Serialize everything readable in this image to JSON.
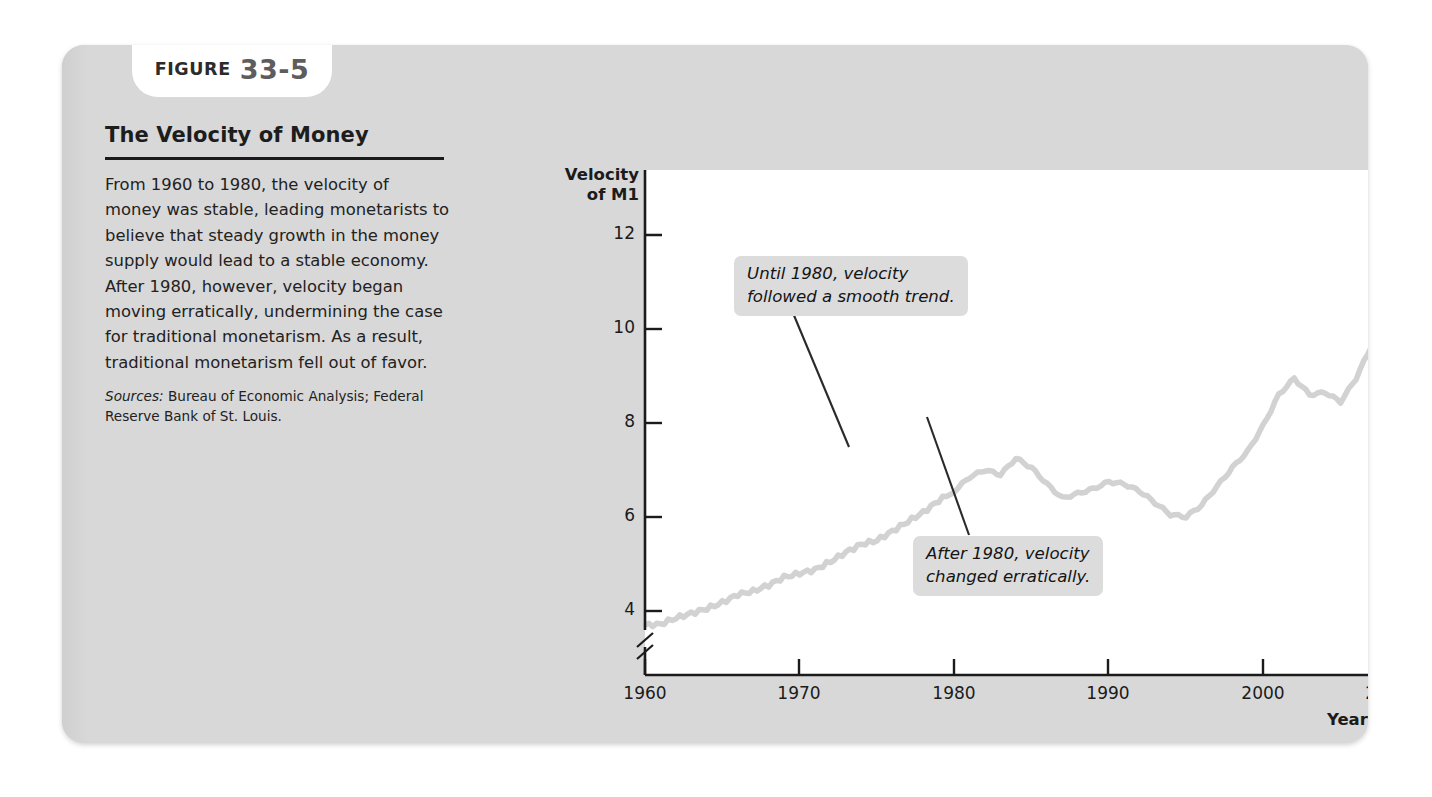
{
  "figure": {
    "tab_word": "FIGURE",
    "tab_number": "33-5",
    "title": "The Velocity of Money",
    "caption": "From 1960 to 1980, the velocity of money was stable, leading monetarists to believe that steady growth in the money supply would lead to a stable economy. After 1980, however, velocity began moving erratically, undermining the case for traditional monetarism. As a result, traditional monetarism fell out of favor.",
    "sources_label": "Sources:",
    "sources_text": " Bureau of Economic Analysis; Federal Reserve Bank of St. Louis.",
    "card_color": "#d8d8d8",
    "line_color": "#d2d2d2",
    "axis_color": "#1b1b1b",
    "callout_bg": "#dcdcdc"
  },
  "chart_data": {
    "type": "line",
    "title": "The Velocity of Money",
    "xlabel": "Year",
    "ylabel": "Velocity of M1",
    "ylabel_line1": "Velocity",
    "ylabel_line2": "of M1",
    "xlim": [
      1960,
      2008
    ],
    "ylim": [
      3.2,
      13.0
    ],
    "y_axis_break": true,
    "y_axis_break_note": "axis broken below 4",
    "grid": false,
    "legend": false,
    "yticks": [
      12,
      10,
      8,
      6,
      4
    ],
    "ytick_labels": [
      "12",
      "10",
      "8",
      "6",
      "4"
    ],
    "xticks": [
      1960,
      1970,
      1980,
      1990,
      2000,
      2008
    ],
    "xtick_labels": [
      "1960",
      "1970",
      "1980",
      "1990",
      "2000",
      "2008"
    ],
    "annotations": [
      {
        "text_line1": "Until 1980, velocity",
        "text_line2": "followed a smooth trend.",
        "points_to_year": 1976,
        "points_to_value": 6.1
      },
      {
        "text_line1": "After 1980, velocity",
        "text_line2": "changed erratically.",
        "points_to_year": 1984,
        "points_to_value": 7.05
      }
    ],
    "series": [
      {
        "name": "Velocity of M1",
        "x": [
          1960,
          1961,
          1962,
          1963,
          1964,
          1965,
          1966,
          1967,
          1968,
          1969,
          1970,
          1971,
          1972,
          1973,
          1974,
          1975,
          1976,
          1977,
          1978,
          1979,
          1980,
          1981,
          1982,
          1983,
          1984,
          1985,
          1986,
          1987,
          1988,
          1989,
          1990,
          1991,
          1992,
          1993,
          1994,
          1995,
          1996,
          1997,
          1998,
          1999,
          2000,
          2001,
          2002,
          2003,
          2004,
          2005,
          2006,
          2007,
          2008
        ],
        "values": [
          3.7,
          3.72,
          3.85,
          3.95,
          4.05,
          4.18,
          4.35,
          4.42,
          4.55,
          4.72,
          4.8,
          4.88,
          5.05,
          5.25,
          5.42,
          5.5,
          5.7,
          5.9,
          6.1,
          6.35,
          6.55,
          6.85,
          7.0,
          6.9,
          7.25,
          7.05,
          6.7,
          6.4,
          6.5,
          6.6,
          6.75,
          6.7,
          6.55,
          6.3,
          6.05,
          6.0,
          6.25,
          6.65,
          7.05,
          7.4,
          7.95,
          8.6,
          8.95,
          8.6,
          8.65,
          8.45,
          8.95,
          9.65,
          10.4
        ]
      }
    ]
  }
}
